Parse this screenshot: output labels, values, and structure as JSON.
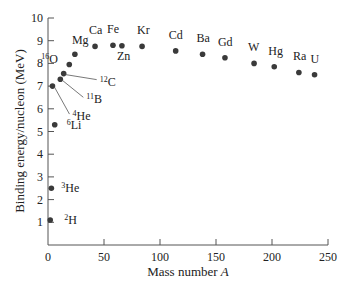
{
  "chart_data": {
    "type": "scatter",
    "title": "",
    "xlabel": "Mass number A",
    "ylabel": "Binding energy/nucleon (MeV)",
    "xlim": [
      0,
      250
    ],
    "ylim": [
      0,
      10
    ],
    "xticks": [
      0,
      50,
      100,
      150,
      200,
      250
    ],
    "yticks": [
      1,
      2,
      3,
      4,
      5,
      6,
      7,
      8,
      9,
      10
    ],
    "grid": false,
    "points": [
      {
        "label": "2H",
        "mass": "2",
        "sym": "H",
        "x": 2,
        "y": 1.1,
        "lx": 14,
        "ly": 4,
        "style": "side"
      },
      {
        "label": "3He",
        "mass": "3",
        "sym": "He",
        "x": 3,
        "y": 2.5,
        "lx": 10,
        "ly": 4,
        "style": "side"
      },
      {
        "label": "4He",
        "mass": "4",
        "sym": "He",
        "x": 4,
        "y": 7.0,
        "lx": 20,
        "ly": 34,
        "style": "leader"
      },
      {
        "label": "6Li",
        "mass": "6",
        "sym": "Li",
        "x": 6,
        "y": 5.3,
        "lx": 12,
        "ly": 4,
        "style": "side"
      },
      {
        "label": "11B",
        "mass": "11",
        "sym": "B",
        "x": 11,
        "y": 7.3,
        "lx": 26,
        "ly": 24,
        "style": "leader"
      },
      {
        "label": "12C",
        "mass": "12",
        "sym": "C",
        "x": 14,
        "y": 7.55,
        "lx": 36,
        "ly": 12,
        "style": "leader"
      },
      {
        "label": "16O",
        "mass": "16",
        "sym": "O",
        "x": 19,
        "y": 7.95,
        "lx": -28,
        "ly": -2,
        "style": "side"
      },
      {
        "label": "Mg",
        "mass": "",
        "sym": "Mg",
        "x": 24,
        "y": 8.4,
        "lx": -3,
        "ly": -10,
        "style": "above"
      },
      {
        "label": "Ca",
        "mass": "",
        "sym": "Ca",
        "x": 42,
        "y": 8.75,
        "lx": -6,
        "ly": -12,
        "style": "above"
      },
      {
        "label": "Fe",
        "mass": "",
        "sym": "Fe",
        "x": 58,
        "y": 8.8,
        "lx": -6,
        "ly": -12,
        "style": "above"
      },
      {
        "label": "Zn",
        "mass": "",
        "sym": "Zn",
        "x": 66,
        "y": 8.78,
        "lx": -5,
        "ly": 14,
        "style": "below"
      },
      {
        "label": "Kr",
        "mass": "",
        "sym": "Kr",
        "x": 84,
        "y": 8.75,
        "lx": -5,
        "ly": -12,
        "style": "above"
      },
      {
        "label": "Cd",
        "mass": "",
        "sym": "Cd",
        "x": 114,
        "y": 8.55,
        "lx": -7,
        "ly": -12,
        "style": "above"
      },
      {
        "label": "Ba",
        "mass": "",
        "sym": "Ba",
        "x": 138,
        "y": 8.4,
        "lx": -6,
        "ly": -12,
        "style": "above"
      },
      {
        "label": "Gd",
        "mass": "",
        "sym": "Gd",
        "x": 158,
        "y": 8.25,
        "lx": -7,
        "ly": -12,
        "style": "above"
      },
      {
        "label": "W",
        "mass": "",
        "sym": "W",
        "x": 184,
        "y": 8.0,
        "lx": -6,
        "ly": -12,
        "style": "above"
      },
      {
        "label": "Hg",
        "mass": "",
        "sym": "Hg",
        "x": 202,
        "y": 7.85,
        "lx": -6,
        "ly": -12,
        "style": "above"
      },
      {
        "label": "Ra",
        "mass": "",
        "sym": "Ra",
        "x": 224,
        "y": 7.6,
        "lx": -6,
        "ly": -12,
        "style": "above"
      },
      {
        "label": "U",
        "mass": "",
        "sym": "U",
        "x": 238,
        "y": 7.5,
        "lx": -4,
        "ly": -12,
        "style": "above"
      }
    ]
  },
  "axes": {
    "xlabel_text": "Mass number ",
    "xlabel_var": "A",
    "ylabel_text": "Binding energy/nucleon (MeV)"
  },
  "colors": {
    "point": "#3a3a3a",
    "axis": "#555555",
    "text": "#222222"
  }
}
